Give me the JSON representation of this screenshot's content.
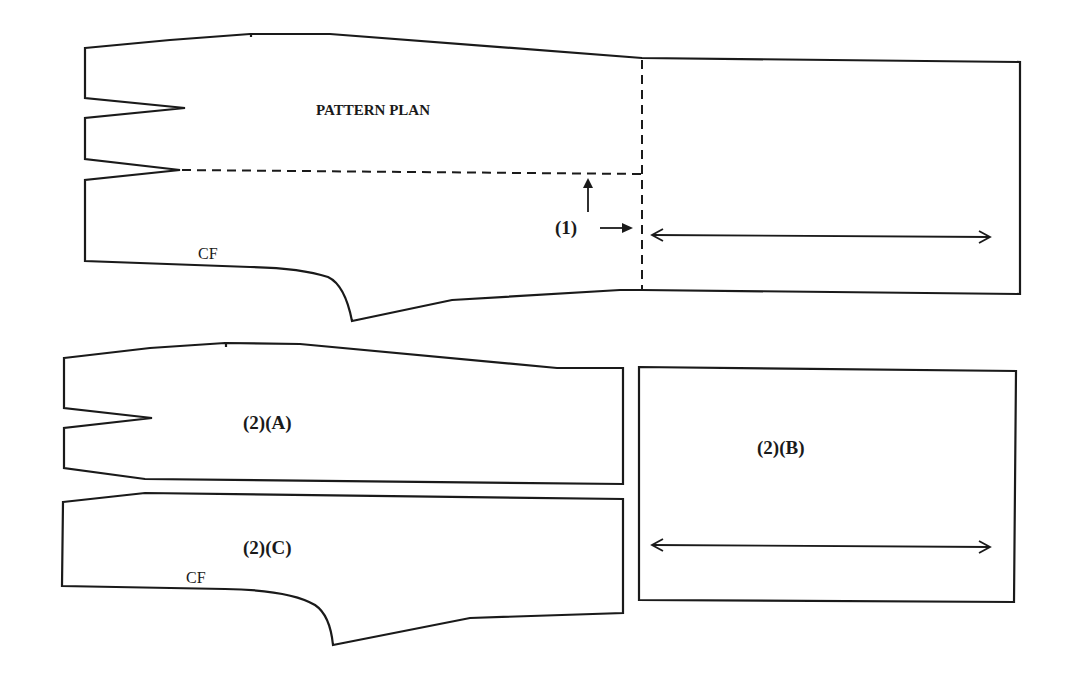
{
  "diagram": {
    "type": "pattern-drafting",
    "colors": {
      "line": "#1a1a1a",
      "background": "#ffffff"
    },
    "top_figure": {
      "title": "PATTERN PLAN",
      "cf_label": "CF",
      "step_label": "(1)",
      "grainline": "double-headed horizontal arrow in right rectangle",
      "slash_lines": [
        "horizontal dashed line from lower dart point",
        "vertical dashed line at panel seam"
      ]
    },
    "pieces": [
      {
        "id": "A",
        "label": "(2)(A)"
      },
      {
        "id": "B",
        "label": "(2)(B)"
      },
      {
        "id": "C",
        "label": "(2)(C)",
        "cf_label": "CF"
      }
    ]
  }
}
